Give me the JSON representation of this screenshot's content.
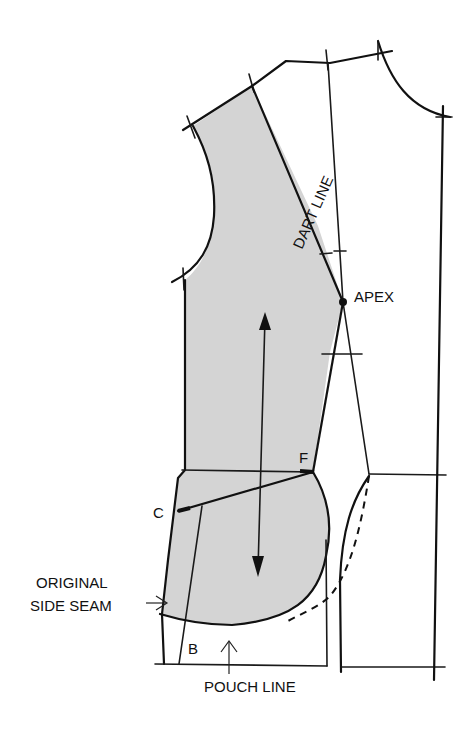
{
  "diagram": {
    "labels": {
      "dart_line": "DART LINE",
      "apex": "APEX",
      "point_f": "F",
      "point_c": "C",
      "point_b": "B",
      "original_side_seam_line1": "ORIGINAL",
      "original_side_seam_line2": "SIDE SEAM",
      "pouch_line": "POUCH LINE"
    },
    "colors": {
      "shaded_piece": "#d4d4d4",
      "stroke": "#1a1a1a",
      "background": "#ffffff"
    },
    "elements": [
      "shaded-side-panel",
      "dart-line",
      "apex-point",
      "grainline-arrow",
      "waistline",
      "line-c-to-f",
      "pouch-curve",
      "dashed-original-curve",
      "center-front-line",
      "armhole-curve",
      "neckline-curve",
      "shoulder-line"
    ]
  }
}
